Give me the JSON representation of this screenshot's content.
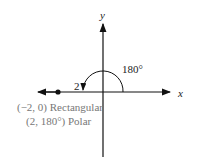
{
  "diagram": {
    "axis_labels": {
      "x": "x",
      "y": "y"
    },
    "angle_label": "180°",
    "radius_label": "2",
    "point": {
      "rectangular": "(−2, 0) Rectangular",
      "polar": "(2, 180°) Polar"
    },
    "colors": {
      "axes": "#111111",
      "text": "#222222",
      "point_text": "#777777"
    }
  }
}
